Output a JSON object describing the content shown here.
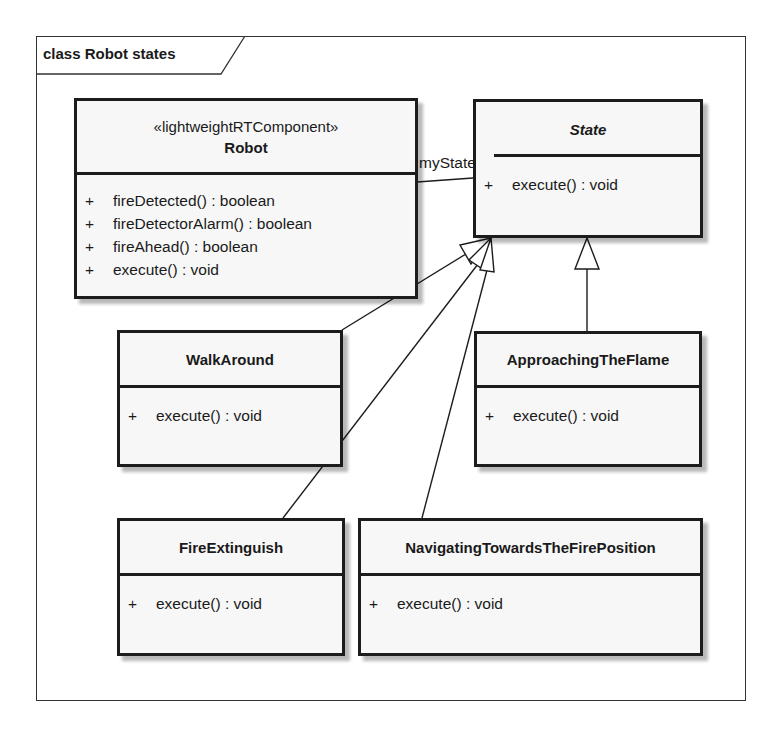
{
  "diagram": {
    "frame": {
      "kind": "class",
      "title": "class Robot states"
    },
    "classes": [
      {
        "id": "robot",
        "stereotype": "«lightweightRTComponent»",
        "name": "Robot",
        "abstract": false,
        "operations": [
          {
            "visibility": "+",
            "signature": "fireDetected() : boolean"
          },
          {
            "visibility": "+",
            "signature": "fireDetectorAlarm() : boolean"
          },
          {
            "visibility": "+",
            "signature": "fireAhead() : boolean"
          },
          {
            "visibility": "+",
            "signature": "execute() : void"
          }
        ]
      },
      {
        "id": "state",
        "name": "State",
        "abstract": true,
        "operations": [
          {
            "visibility": "+",
            "signature": "execute() : void"
          }
        ]
      },
      {
        "id": "walkaround",
        "name": "WalkAround",
        "abstract": false,
        "operations": [
          {
            "visibility": "+",
            "signature": "execute() : void"
          }
        ]
      },
      {
        "id": "approaching",
        "name": "ApproachingTheFlame",
        "abstract": false,
        "operations": [
          {
            "visibility": "+",
            "signature": "execute() : void"
          }
        ]
      },
      {
        "id": "fireextinguish",
        "name": "FireExtinguish",
        "abstract": false,
        "operations": [
          {
            "visibility": "+",
            "signature": "execute() : void"
          }
        ]
      },
      {
        "id": "navigating",
        "name": "NavigatingTowardsTheFirePosition",
        "abstract": false,
        "operations": [
          {
            "visibility": "+",
            "signature": "execute() : void"
          }
        ]
      }
    ],
    "relationships": [
      {
        "type": "association",
        "from": "Robot",
        "to": "State",
        "role": "myState"
      },
      {
        "type": "generalization",
        "from": "WalkAround",
        "to": "State"
      },
      {
        "type": "generalization",
        "from": "ApproachingTheFlame",
        "to": "State"
      },
      {
        "type": "generalization",
        "from": "FireExtinguish",
        "to": "State"
      },
      {
        "type": "generalization",
        "from": "NavigatingTowardsTheFirePosition",
        "to": "State"
      }
    ],
    "colors": {
      "line": "#1c1c1c",
      "class_fill": "#f7f7f7",
      "background": "#ffffff"
    }
  }
}
